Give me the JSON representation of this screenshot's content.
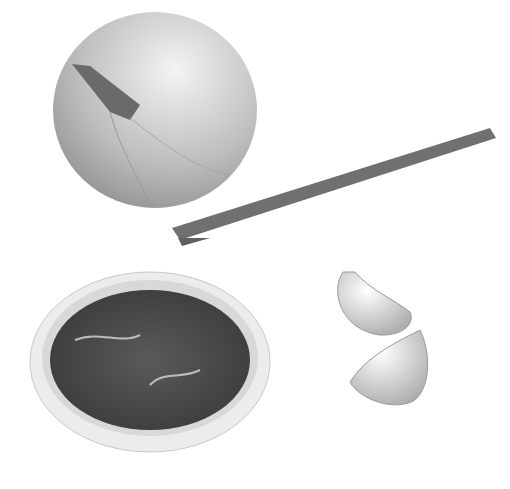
{
  "scene": {
    "description": "Grayscale photo of cooking ingredients on white background",
    "items": [
      {
        "name": "onion"
      },
      {
        "name": "cinnamon-stick"
      },
      {
        "name": "bowl-of-tamarind"
      },
      {
        "name": "garlic-clove-1"
      },
      {
        "name": "garlic-clove-2"
      }
    ],
    "colors": {
      "background": "#ffffff",
      "onion": "#c8c8c8",
      "cinnamon": "#6e6e6e",
      "bowl": "#e6e6e6",
      "tamarind": "#4a4a4a",
      "garlic": "#dcdcdc"
    }
  }
}
